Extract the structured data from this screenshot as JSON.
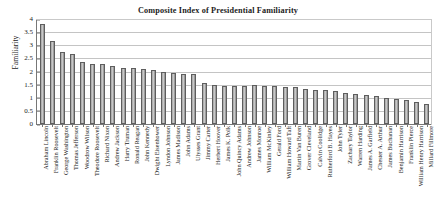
{
  "chart_data": {
    "type": "bar",
    "title": "Composite Index of Presidential Familiarity",
    "xlabel": "",
    "ylabel": "Familiarity",
    "ylim": [
      0,
      4
    ],
    "yticks": [
      "0",
      "0.5",
      "1",
      "1.5",
      "2",
      "2.5",
      "3",
      "3.5",
      "4"
    ],
    "grid": true,
    "legend": "none",
    "categories": [
      "Abraham Lincoln",
      "Franklin Roosevelt",
      "George Washington",
      "Thomas Jefferson",
      "Woodrow Wilson",
      "Theodore Roosevelt",
      "Richard Nixon",
      "Andrew Jackson",
      "Harry Truman",
      "Ronald Reagan",
      "John Kennedy",
      "Dwight Eisenhower",
      "Lyndon Johnson",
      "James Madison",
      "John Adams",
      "Ulysses Grant",
      "Jimmy Carter",
      "Herbert Hoover",
      "James K. Polk",
      "John Quincy Adams",
      "Andrew Johnson",
      "James Monroe",
      "William McKinley",
      "Gerald Ford",
      "William Howard Taft",
      "Martin Van Buren",
      "Grover Cleveland",
      "Calvin Coolidge",
      "Rutherford B. Hayes",
      "John Tyler",
      "Zachary Taylor",
      "Warren Harding",
      "James A. Garfield",
      "Chester A. Arthur",
      "James Buchanan",
      "Benjamin Harrison",
      "Franklin Pierce",
      "William Henry Harrison",
      "Millard Fillmore"
    ],
    "values": [
      3.8,
      3.15,
      2.75,
      2.65,
      2.35,
      2.3,
      2.3,
      2.2,
      2.15,
      2.15,
      2.1,
      2.05,
      2.0,
      1.95,
      1.9,
      1.9,
      1.55,
      1.5,
      1.45,
      1.45,
      1.45,
      1.5,
      1.45,
      1.45,
      1.4,
      1.4,
      1.35,
      1.3,
      1.3,
      1.25,
      1.2,
      1.15,
      1.1,
      1.05,
      1.0,
      0.95,
      0.9,
      0.85,
      0.75
    ]
  },
  "colors": {
    "bar_fill": "#b7b7b7",
    "bar_edge": "#5e5e5e",
    "gridline": "#c4c4c4",
    "axis": "#777777",
    "text": "#1c1c1c",
    "background": "#ffffff"
  }
}
